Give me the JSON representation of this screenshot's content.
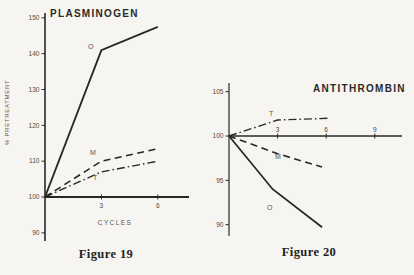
{
  "page": {
    "background": "#f6f5f2",
    "ink": "#2a2824"
  },
  "chart_data": [
    {
      "type": "line",
      "title": "PLASMINOGEN",
      "ylabel": "% PRETREATMENT",
      "xlabel": "CYCLES",
      "caption": "Figure 19",
      "x_ticks": [
        3,
        6
      ],
      "y_ticks": [
        150,
        140,
        130,
        120,
        110,
        100,
        90
      ],
      "xlim": [
        0,
        7.7
      ],
      "ylim": [
        88,
        152
      ],
      "baseline": 100,
      "grid": "off",
      "legend": "inline-labels",
      "series": [
        {
          "name": "O",
          "style": "solid",
          "points": [
            [
              0,
              100
            ],
            [
              3,
              141
            ],
            [
              6,
              147.5
            ]
          ]
        },
        {
          "name": "M",
          "style": "dashed",
          "points": [
            [
              0,
              100
            ],
            [
              3,
              110
            ],
            [
              6,
              113.5
            ]
          ]
        },
        {
          "name": "T",
          "style": "dashdot",
          "points": [
            [
              0,
              100
            ],
            [
              3,
              107
            ],
            [
              6,
              110
            ]
          ]
        }
      ]
    },
    {
      "type": "line",
      "title": "ANTITHROMBIN",
      "ylabel": "",
      "xlabel": "",
      "caption": "Figure 20",
      "x_ticks": [
        3,
        6,
        9
      ],
      "y_ticks": [
        105,
        100,
        95,
        90
      ],
      "xlim": [
        0,
        10.7
      ],
      "ylim": [
        89,
        105.5
      ],
      "baseline": 100,
      "grid": "off",
      "legend": "inline-labels",
      "series": [
        {
          "name": "T",
          "style": "dashdot",
          "points": [
            [
              0,
              100
            ],
            [
              3,
              101.8
            ],
            [
              6.1,
              102
            ]
          ]
        },
        {
          "name": "M",
          "style": "dashed",
          "points": [
            [
              0,
              100
            ],
            [
              3,
              98
            ],
            [
              5.75,
              96.5
            ]
          ]
        },
        {
          "name": "O",
          "style": "solid",
          "points": [
            [
              0,
              100
            ],
            [
              2.7,
              94
            ],
            [
              5.75,
              89.7
            ]
          ]
        }
      ]
    }
  ]
}
